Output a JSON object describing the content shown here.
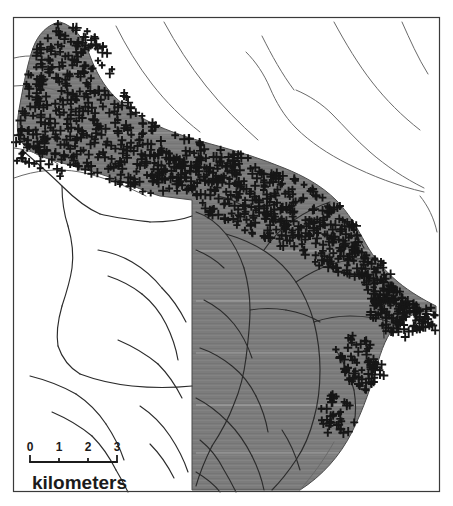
{
  "figure": {
    "type": "map",
    "frame": {
      "x": 13,
      "y": 17,
      "width": 427,
      "height": 475,
      "stroke": "#3a3a3a",
      "stroke_width": 1.2
    },
    "background_color": "#ffffff"
  },
  "legend_scale": {
    "name": "scale-bar",
    "unit_label": "kilometers",
    "tick_labels": [
      "0",
      "1",
      "2",
      "3"
    ],
    "tick_values": [
      0,
      1,
      2,
      3
    ],
    "bar_x_start": 30,
    "bar_x_end": 117,
    "bar_y": 462,
    "tick_height": 7,
    "color": "#1b1b1b"
  },
  "map_layers": {
    "shaded_unit": {
      "name": "shaded-map-unit",
      "fill": "#7c7c7c",
      "stroke": "#4a4a4a",
      "texture": "horizontal-streak-raster"
    },
    "point_symbols": {
      "name": "plus-symbol-stipple",
      "glyph": "+",
      "color": "#161616",
      "size_px": 8,
      "stroke_width": 1.9,
      "count": 1180,
      "description": "Dense plus/cross markers concentrated over the upper arm of the shaded unit and along its northern and eastern boundaries."
    },
    "stream_network": {
      "name": "stream-network",
      "color": "#2b2b2b",
      "stroke_width": 1.15,
      "description": "Dendritic drainage lines crossing both shaded and unshaded terrain."
    },
    "boundary_lines": {
      "name": "terrain-boundary-lines",
      "color": "#5a5a5a",
      "stroke_width": 1.0
    }
  },
  "chart_data": {
    "type": "map",
    "title": "",
    "xlabel": "",
    "ylabel": "",
    "scale_bar_km": [
      0,
      1,
      2,
      3
    ],
    "scale_unit": "kilometers",
    "legend_position": "bottom-left",
    "grid": false
  }
}
